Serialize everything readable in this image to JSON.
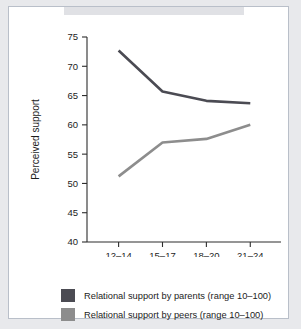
{
  "chart_data": {
    "type": "line",
    "title": "",
    "xlabel": "Age",
    "ylabel": "Perceived support",
    "categories": [
      "12–14",
      "15–17",
      "18–20",
      "21–24"
    ],
    "ylim": [
      40,
      75
    ],
    "yticks": [
      40,
      45,
      50,
      55,
      60,
      65,
      70,
      75
    ],
    "ytick_labels": [
      "40",
      "45",
      "50",
      "55",
      "60",
      "65",
      "70",
      "75"
    ],
    "grid": false,
    "legend_position": "bottom",
    "series": [
      {
        "name": "Relational support by parents (range 10–100)",
        "short_name": "parents",
        "color": "#4b4b53",
        "values": [
          72.7,
          65.7,
          64.1,
          63.7
        ]
      },
      {
        "name": "Relational support by peers (range 10–100)",
        "short_name": "peers",
        "color": "#8d8d8d",
        "values": [
          51.2,
          57.0,
          57.6,
          60.0
        ]
      }
    ]
  },
  "colors": {
    "page_background": "#e8e9ec",
    "card_background": "#ffffff",
    "card_border": "#b9bfc9",
    "axis": "#2d2d2d",
    "text": "#1c1c1c"
  }
}
